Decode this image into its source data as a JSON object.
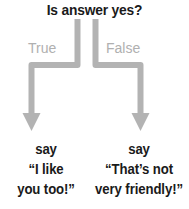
{
  "flowchart": {
    "title": "Is answer yes?",
    "colors": {
      "arrow": "#b3b3b3",
      "label": "#b0b0b0",
      "text": "#1a1a1a",
      "background": "#ffffff"
    },
    "branches": [
      {
        "condition_label": "True",
        "outcome": {
          "line1": "say",
          "line2": "“I like",
          "line3": "you too!”"
        }
      },
      {
        "condition_label": "False",
        "outcome": {
          "line1": "say",
          "line2": "“That’s not",
          "line3": "very friendly!”"
        }
      }
    ]
  }
}
